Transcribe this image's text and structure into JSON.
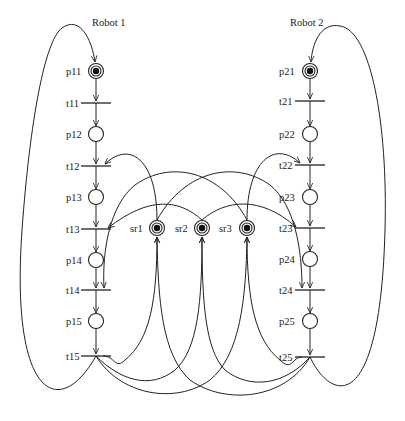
{
  "diagram": {
    "type": "petri-net",
    "colors": {
      "stroke": "#222222",
      "background": "#ffffff",
      "token": "#111111"
    },
    "robots": [
      {
        "title": "Robot 1",
        "places": [
          {
            "id": "p11",
            "label": "p11",
            "marked": true
          },
          {
            "id": "p12",
            "label": "p12",
            "marked": false
          },
          {
            "id": "p13",
            "label": "p13",
            "marked": false
          },
          {
            "id": "p14",
            "label": "p14",
            "marked": false
          },
          {
            "id": "p15",
            "label": "p15",
            "marked": false
          }
        ],
        "transitions": [
          {
            "id": "t11",
            "label": "t11"
          },
          {
            "id": "t12",
            "label": "t12"
          },
          {
            "id": "t13",
            "label": "t13"
          },
          {
            "id": "t14",
            "label": "t14"
          },
          {
            "id": "t15",
            "label": "t15"
          }
        ]
      },
      {
        "title": "Robot 2",
        "places": [
          {
            "id": "p21",
            "label": "p21",
            "marked": true
          },
          {
            "id": "p22",
            "label": "p22",
            "marked": false
          },
          {
            "id": "p23",
            "label": "p23",
            "marked": false
          },
          {
            "id": "p24",
            "label": "p24",
            "marked": false
          },
          {
            "id": "p25",
            "label": "p25",
            "marked": false
          }
        ],
        "transitions": [
          {
            "id": "t21",
            "label": "t21"
          },
          {
            "id": "t22",
            "label": "t22"
          },
          {
            "id": "t23",
            "label": "t23"
          },
          {
            "id": "t24",
            "label": "t24"
          },
          {
            "id": "t25",
            "label": "t25"
          }
        ]
      }
    ],
    "resources": [
      {
        "id": "sr1",
        "label": "sr1",
        "marked": true
      },
      {
        "id": "sr2",
        "label": "sr2",
        "marked": true
      },
      {
        "id": "sr3",
        "label": "sr3",
        "marked": true
      }
    ],
    "arcs": [
      [
        "t15",
        "p11"
      ],
      [
        "p11",
        "t11"
      ],
      [
        "t11",
        "p12"
      ],
      [
        "p12",
        "t12"
      ],
      [
        "t12",
        "p13"
      ],
      [
        "p13",
        "t13"
      ],
      [
        "t13",
        "p14"
      ],
      [
        "p14",
        "t14"
      ],
      [
        "t14",
        "p15"
      ],
      [
        "p15",
        "t15"
      ],
      [
        "t25",
        "p21"
      ],
      [
        "p21",
        "t21"
      ],
      [
        "t21",
        "p22"
      ],
      [
        "p22",
        "t22"
      ],
      [
        "t22",
        "p23"
      ],
      [
        "p23",
        "t23"
      ],
      [
        "t23",
        "p24"
      ],
      [
        "p24",
        "t24"
      ],
      [
        "t24",
        "p25"
      ],
      [
        "p25",
        "t25"
      ],
      [
        "sr1",
        "t12"
      ],
      [
        "sr2",
        "t13"
      ],
      [
        "sr3",
        "t14"
      ],
      [
        "sr3",
        "t22"
      ],
      [
        "sr2",
        "t23"
      ],
      [
        "sr1",
        "t24"
      ],
      [
        "t15",
        "sr1"
      ],
      [
        "t15",
        "sr2"
      ],
      [
        "t15",
        "sr3"
      ],
      [
        "t25",
        "sr1"
      ],
      [
        "t25",
        "sr2"
      ],
      [
        "t25",
        "sr3"
      ]
    ]
  }
}
